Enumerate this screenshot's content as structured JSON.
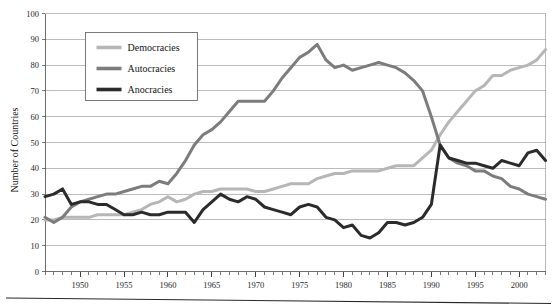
{
  "chart_data": {
    "type": "line",
    "title": "",
    "subtitle": "",
    "xlabel": "",
    "ylabel": "Number of Countries",
    "xlim": [
      1946,
      2003
    ],
    "ylim": [
      0,
      100
    ],
    "ytick_step": 10,
    "xtick_major_step": 5,
    "xtick_minor_step": 1,
    "grid": "horizontal",
    "legend_position": "upper-left-inside",
    "yticks": [
      0,
      10,
      20,
      30,
      40,
      50,
      60,
      70,
      80,
      90,
      100
    ],
    "ytick_labels": [
      "0",
      "10",
      "20",
      "30",
      "40",
      "50",
      "60",
      "70",
      "80",
      "90",
      "100"
    ],
    "xticks": [
      1950,
      1955,
      1960,
      1965,
      1970,
      1975,
      1980,
      1985,
      1990,
      1995,
      2000
    ],
    "xtick_labels": [
      "1950",
      "1955",
      "1960",
      "1965",
      "1970",
      "1975",
      "1980",
      "1985",
      "1990",
      "1995",
      "2000"
    ],
    "x": [
      1946,
      1947,
      1948,
      1949,
      1950,
      1951,
      1952,
      1953,
      1954,
      1955,
      1956,
      1957,
      1958,
      1959,
      1960,
      1961,
      1962,
      1963,
      1964,
      1965,
      1966,
      1967,
      1968,
      1969,
      1970,
      1971,
      1972,
      1973,
      1974,
      1975,
      1976,
      1977,
      1978,
      1979,
      1980,
      1981,
      1982,
      1983,
      1984,
      1985,
      1986,
      1987,
      1988,
      1989,
      1990,
      1991,
      1992,
      1993,
      1994,
      1995,
      1996,
      1997,
      1998,
      1999,
      2000,
      2001,
      2002,
      2003
    ],
    "series": [
      {
        "name": "Democracies",
        "color": "#b6b6b6",
        "linewidth": 3.0,
        "values": [
          20,
          20,
          21,
          21,
          21,
          21,
          22,
          22,
          22,
          22,
          23,
          24,
          26,
          27,
          29,
          27,
          28,
          30,
          31,
          31,
          32,
          32,
          32,
          32,
          31,
          31,
          32,
          33,
          34,
          34,
          34,
          36,
          37,
          38,
          38,
          39,
          39,
          39,
          39,
          40,
          41,
          41,
          41,
          44,
          47,
          53,
          58,
          62,
          66,
          70,
          72,
          76,
          76,
          78,
          79,
          80,
          82,
          86
        ]
      },
      {
        "name": "Autocracies",
        "color": "#7c7c7c",
        "linewidth": 3.0,
        "values": [
          21,
          19,
          21,
          25,
          27,
          28,
          29,
          30,
          30,
          31,
          32,
          33,
          33,
          35,
          34,
          38,
          43,
          49,
          53,
          55,
          58,
          62,
          66,
          66,
          66,
          66,
          70,
          75,
          79,
          83,
          85,
          88,
          82,
          79,
          80,
          78,
          79,
          80,
          81,
          80,
          79,
          77,
          74,
          70,
          60,
          49,
          44,
          42,
          41,
          39,
          39,
          37,
          36,
          33,
          32,
          30,
          29,
          28
        ]
      },
      {
        "name": "Anocracies",
        "color": "#2b2b2b",
        "linewidth": 3.0,
        "values": [
          29,
          30,
          32,
          26,
          27,
          27,
          26,
          26,
          24,
          22,
          22,
          23,
          22,
          22,
          23,
          23,
          23,
          19,
          24,
          27,
          30,
          28,
          27,
          29,
          28,
          25,
          24,
          23,
          22,
          25,
          26,
          25,
          21,
          20,
          17,
          18,
          14,
          13,
          15,
          19,
          19,
          18,
          19,
          21,
          26,
          49,
          44,
          43,
          42,
          42,
          41,
          40,
          43,
          42,
          41,
          46,
          47,
          43
        ]
      }
    ],
    "legend": [
      {
        "label": "Democracies",
        "color": "#b6b6b6"
      },
      {
        "label": "Autocracies",
        "color": "#7c7c7c"
      },
      {
        "label": "Anocracies",
        "color": "#2b2b2b"
      }
    ]
  }
}
